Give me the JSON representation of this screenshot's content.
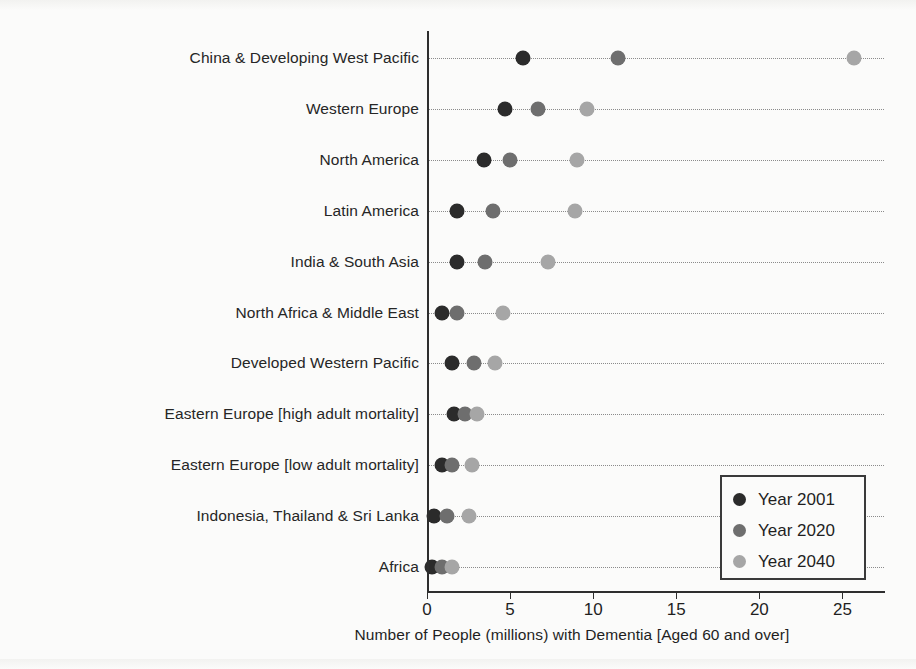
{
  "chart_data": {
    "type": "scatter",
    "title": "",
    "xlabel": "Number of People (millions) with Dementia [Aged 60 and over]",
    "ylabel": "",
    "xlim": [
      0,
      27.5
    ],
    "xticks": [
      0,
      5,
      10,
      15,
      20,
      25
    ],
    "grid": true,
    "grid_style": "dotted horizontal",
    "legend_position": "lower right",
    "categories": [
      "China & Developing West Pacific",
      "Western Europe",
      "North America",
      "Latin America",
      "India & South Asia",
      "North Africa & Middle East",
      "Developed Western Pacific",
      "Eastern Europe [high adult mortality]",
      "Eastern Europe [low adult mortality]",
      "Indonesia, Thailand & Sri Lanka",
      "Africa"
    ],
    "series": [
      {
        "name": "Year 2001",
        "color": "#2b2b2b",
        "values": [
          5.8,
          4.7,
          3.4,
          1.8,
          1.8,
          0.9,
          1.5,
          1.6,
          0.9,
          0.4,
          0.3
        ]
      },
      {
        "name": "Year 2020",
        "color": "#6e6e6e",
        "values": [
          11.5,
          6.7,
          5.0,
          4.0,
          3.5,
          1.8,
          2.8,
          2.3,
          1.5,
          1.2,
          0.9
        ]
      },
      {
        "name": "Year 2040",
        "color": "#a6a6a6",
        "values": [
          25.7,
          9.6,
          9.0,
          8.9,
          7.3,
          4.6,
          4.1,
          3.0,
          2.7,
          2.5,
          1.5
        ]
      }
    ]
  },
  "legend": {
    "items": [
      {
        "label": "Year 2001",
        "color": "#2b2b2b"
      },
      {
        "label": "Year 2020",
        "color": "#6e6e6e"
      },
      {
        "label": "Year 2040",
        "color": "#a6a6a6"
      }
    ]
  },
  "axis": {
    "x_tick_labels": [
      "0",
      "5",
      "10",
      "15",
      "20",
      "25"
    ],
    "x_axis_title": "Number of People (millions) with Dementia [Aged 60 and over]"
  }
}
